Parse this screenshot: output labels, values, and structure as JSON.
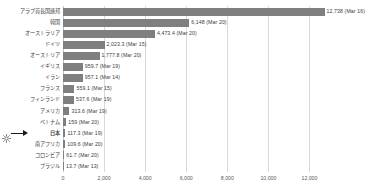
{
  "chart_data": {
    "type": "bar",
    "orientation": "horizontal",
    "title": "",
    "xlabel": "",
    "ylabel": "",
    "xlim": [
      0,
      13000
    ],
    "grid": true,
    "legend": "none",
    "bar_color": "#7f7f7f",
    "xticks": [
      "0",
      "2,000",
      "4,000",
      "6,000",
      "8,000",
      "10,000",
      "12,000"
    ],
    "xtick_values": [
      0,
      2000,
      4000,
      6000,
      8000,
      10000,
      12000
    ],
    "categories": [
      "アラブ首長国連邦",
      "韓国",
      "オーストラリア",
      "ドイツ",
      "オーストリア",
      "イギリス",
      "イラン",
      "フランス",
      "フィンランド",
      "アメリカ",
      "ベトナム",
      "日本",
      "南アフリカ",
      "コロンビア",
      "ブラジル"
    ],
    "values": [
      12738,
      6148,
      4473.4,
      2023.3,
      1777.8,
      959.7,
      957.1,
      559.1,
      537.6,
      313.6,
      159,
      117.3,
      109.6,
      61.7,
      13.7
    ],
    "value_labels": [
      "12,738  (Mar 16)",
      "6,148  (Mar 20)",
      "4,473.4  (Mar 20)",
      "2,023.3  (Mar 15)",
      "1,777.8  (Mar 20)",
      "959.7  (Mar 19)",
      "957.1  (Mar 14)",
      "559.1  (Mar 15)",
      "537.6  (Mar 19)",
      "313.6  (Mar 19)",
      "159  (Mar 20)",
      "117.3  (Mar 19)",
      "109.6  (Mar 20)",
      "61.7  (Mar 20)",
      "13.7  (Mar 13)"
    ],
    "highlight_category": "日本",
    "annotation": {
      "target": "日本",
      "marker": "sun-icon",
      "arrow": "right-arrow"
    }
  }
}
